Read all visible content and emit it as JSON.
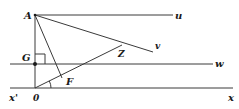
{
  "figure": {
    "type": "geometry-diagram",
    "colors": {
      "line": "#3a3a3a",
      "text": "#1a1a1a",
      "background": "#ffffff"
    },
    "points": {
      "A": {
        "label": "A",
        "x": 35,
        "y": 15
      },
      "G": {
        "label": "G",
        "x": 35,
        "y": 64
      },
      "O": {
        "label": "O",
        "x": 35,
        "y": 88
      },
      "F": {
        "label": "F",
        "x": 62,
        "y": 78
      },
      "Z": {
        "label": "Z",
        "x": 122,
        "y": 45
      }
    },
    "labels": {
      "A": "A",
      "G": "G",
      "O": "0",
      "F": "F",
      "Z": "Z",
      "U": "u",
      "V": "v",
      "W": "w",
      "x": "x",
      "x_prime": "x'"
    },
    "lines": [
      {
        "name": "AU",
        "from": [
          35,
          15
        ],
        "to": [
          173,
          15
        ]
      },
      {
        "name": "AV",
        "from": [
          35,
          15
        ],
        "to": [
          153,
          52
        ]
      },
      {
        "name": "AO",
        "from": [
          35,
          15
        ],
        "to": [
          35,
          88
        ]
      },
      {
        "name": "AF",
        "from": [
          35,
          15
        ],
        "to": [
          62,
          78
        ]
      },
      {
        "name": "OZ",
        "from": [
          35,
          88
        ],
        "to": [
          122,
          45
        ]
      },
      {
        "name": "W-line",
        "from": [
          10,
          64
        ],
        "to": [
          213,
          64
        ]
      },
      {
        "name": "x-axis",
        "from": [
          10,
          88
        ],
        "to": [
          233,
          88
        ]
      }
    ],
    "annotations": {
      "right_angle_at": "G",
      "angle_arc_at": "O"
    }
  }
}
